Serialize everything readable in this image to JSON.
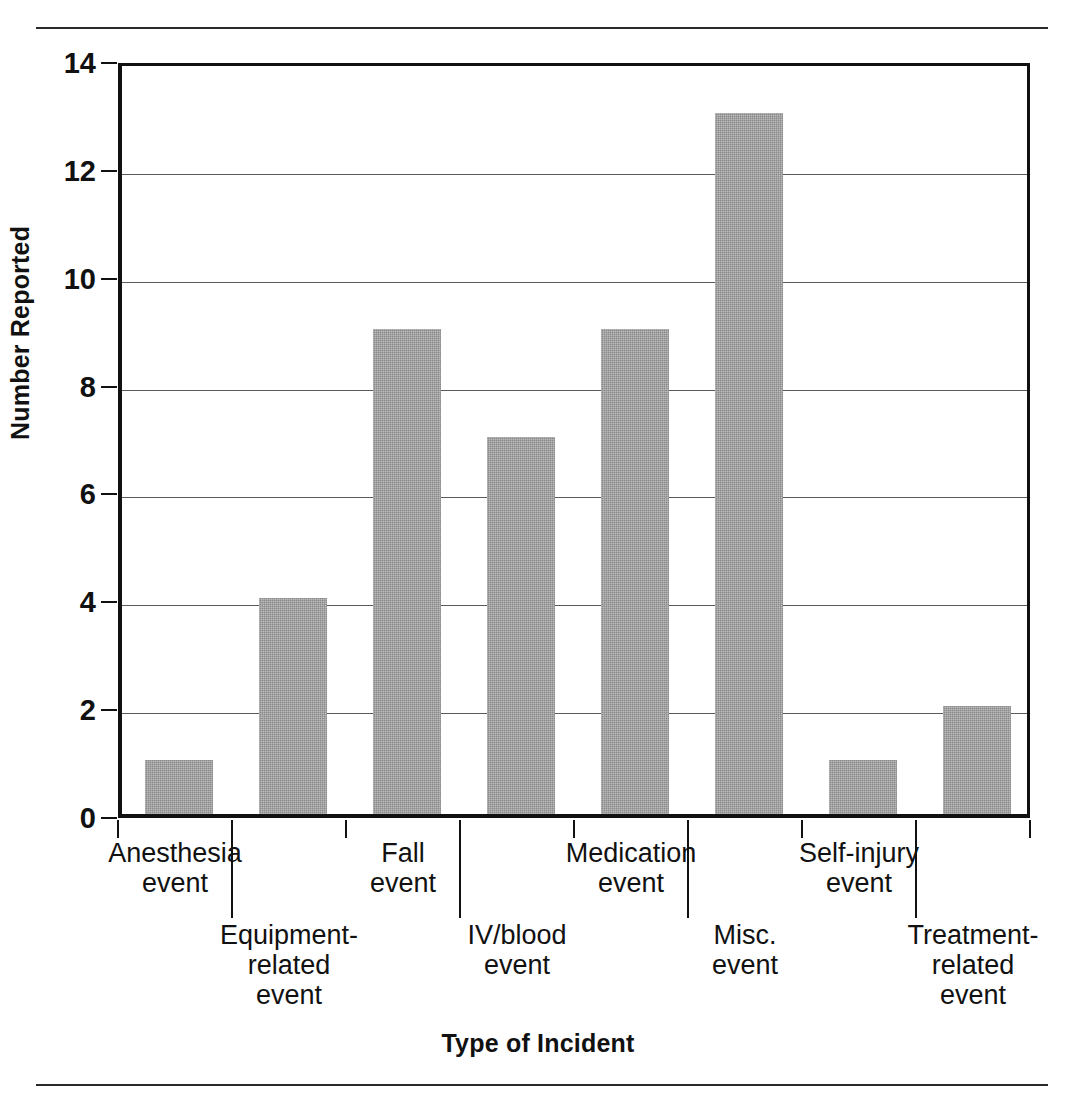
{
  "chart_data": {
    "type": "bar",
    "title": "",
    "xlabel": "Type of Incident",
    "ylabel": "Number Reported",
    "categories": [
      "Anesthesia\nevent",
      "Equipment-\nrelated\nevent",
      "Fall\nevent",
      "IV/blood\nevent",
      "Medication\nevent",
      "Misc.\nevent",
      "Self-injury\nevent",
      "Treatment-\nrelated\nevent"
    ],
    "category_lines": [
      [
        "Anesthesia",
        "event"
      ],
      [
        "Equipment-",
        "related",
        "event"
      ],
      [
        "Fall",
        "event"
      ],
      [
        "IV/blood",
        "event"
      ],
      [
        "Medication",
        "event"
      ],
      [
        "Misc.",
        "event"
      ],
      [
        "Self-injury",
        "event"
      ],
      [
        "Treatment-",
        "related",
        "event"
      ]
    ],
    "values": [
      1,
      4,
      9,
      7,
      9,
      13,
      1,
      2
    ],
    "ylim": [
      0,
      14
    ],
    "ytick_labels": [
      "0",
      "2",
      "4",
      "6",
      "8",
      "10",
      "12",
      "14"
    ],
    "ytick_values": [
      0,
      2,
      4,
      6,
      8,
      10,
      12,
      14
    ],
    "grid": "horizontal",
    "legend": "none",
    "bar_color": "#8a8a8a",
    "axis_color": "#111111",
    "gridline_color": "#5a5a5a"
  },
  "axes": {
    "y_title": "Number Reported",
    "x_title": "Type of Incident"
  }
}
